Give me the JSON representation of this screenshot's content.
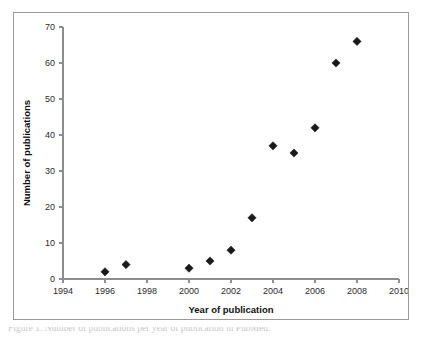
{
  "chart_data": {
    "type": "scatter",
    "title": "",
    "xlabel": "Year of publication",
    "ylabel": "Number of publications",
    "xlim": [
      1994,
      2010
    ],
    "ylim": [
      0,
      70
    ],
    "grid": false,
    "legend": false,
    "marker": "diamond",
    "marker_color": "#1a1a1a",
    "xticks": [
      "1994",
      "1996",
      "1998",
      "2000",
      "2002",
      "2004",
      "2006",
      "2008",
      "2010"
    ],
    "yticks": [
      "0",
      "10",
      "20",
      "30",
      "40",
      "50",
      "60",
      "70"
    ],
    "x": [
      1996,
      1997,
      2000,
      2001,
      2002,
      2003,
      2004,
      2005,
      2006,
      2007,
      2008
    ],
    "values": [
      2,
      4,
      3,
      5,
      8,
      17,
      37,
      35,
      42,
      60,
      66
    ],
    "series": [
      {
        "name": "Publications",
        "points": [
          {
            "x": 1996,
            "y": 2
          },
          {
            "x": 1997,
            "y": 4
          },
          {
            "x": 2000,
            "y": 3
          },
          {
            "x": 2001,
            "y": 5
          },
          {
            "x": 2002,
            "y": 8
          },
          {
            "x": 2003,
            "y": 17
          },
          {
            "x": 2004,
            "y": 37
          },
          {
            "x": 2005,
            "y": 35
          },
          {
            "x": 2006,
            "y": 42
          },
          {
            "x": 2007,
            "y": 60
          },
          {
            "x": 2008,
            "y": 66
          }
        ]
      }
    ]
  },
  "caption": {
    "text": "Figure 1. Number of publications per year of publication in PubMed."
  },
  "colors": {
    "axis": "#8d8d8d",
    "frame": "#9a9a9a",
    "marker": "#1a1a1a",
    "text": "#2b2b2b",
    "background": "#ffffff"
  }
}
